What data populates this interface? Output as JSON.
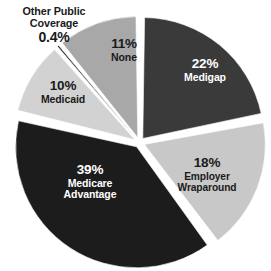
{
  "chart_data": {
    "type": "pie",
    "title": "",
    "subtitle": "",
    "xlabel": "",
    "ylabel": "",
    "legend_position": "none",
    "grid": false,
    "exploded": true,
    "categories": [
      "Medigap",
      "Employer Wraparound",
      "Medicare Advantage",
      "Medicaid",
      "Other Public Coverage",
      "None"
    ],
    "values": [
      22,
      18,
      39,
      10,
      0.4,
      11
    ],
    "value_labels": [
      "22%",
      "18%",
      "39%",
      "10%",
      "0.4%",
      "11%"
    ],
    "slices": [
      {
        "name": "Medigap",
        "value": 22,
        "value_label": "22%",
        "color": "#3a3a3a",
        "text_color": "#ffffff",
        "label_placement": "inside"
      },
      {
        "name": "Employer Wraparound",
        "value": 18,
        "value_label": "18%",
        "color": "#c8c8c8",
        "text_color": "#1a1a1a",
        "label_placement": "inside"
      },
      {
        "name": "Medicare Advantage",
        "value": 39,
        "value_label": "39%",
        "color": "#1c1c1c",
        "text_color": "#ffffff",
        "label_placement": "inside"
      },
      {
        "name": "Medicaid",
        "value": 10,
        "value_label": "10%",
        "color": "#d2d2d2",
        "text_color": "#1a1a1a",
        "label_placement": "inside"
      },
      {
        "name": "Other Public Coverage",
        "value": 0.4,
        "value_label": "0.4%",
        "color": "#0d0d0d",
        "text_color": "#1a1a1a",
        "label_placement": "callout"
      },
      {
        "name": "None",
        "value": 11,
        "value_label": "11%",
        "color": "#a8a8a8",
        "text_color": "#1a1a1a",
        "label_placement": "inside"
      }
    ]
  },
  "labels": {
    "medigap": {
      "pct": "22%",
      "name": "Medigap"
    },
    "employer_wraparound": {
      "pct": "18%",
      "name_line1": "Employer",
      "name_line2": "Wraparound"
    },
    "medicare_advantage": {
      "pct": "39%",
      "name_line1": "Medicare",
      "name_line2": "Advantage"
    },
    "medicaid": {
      "pct": "10%",
      "name": "Medicaid"
    },
    "none": {
      "pct": "11%",
      "name": "None"
    },
    "other_public": {
      "name_line1": "Other Public",
      "name_line2": "Coverage",
      "pct": "0.4%"
    }
  }
}
